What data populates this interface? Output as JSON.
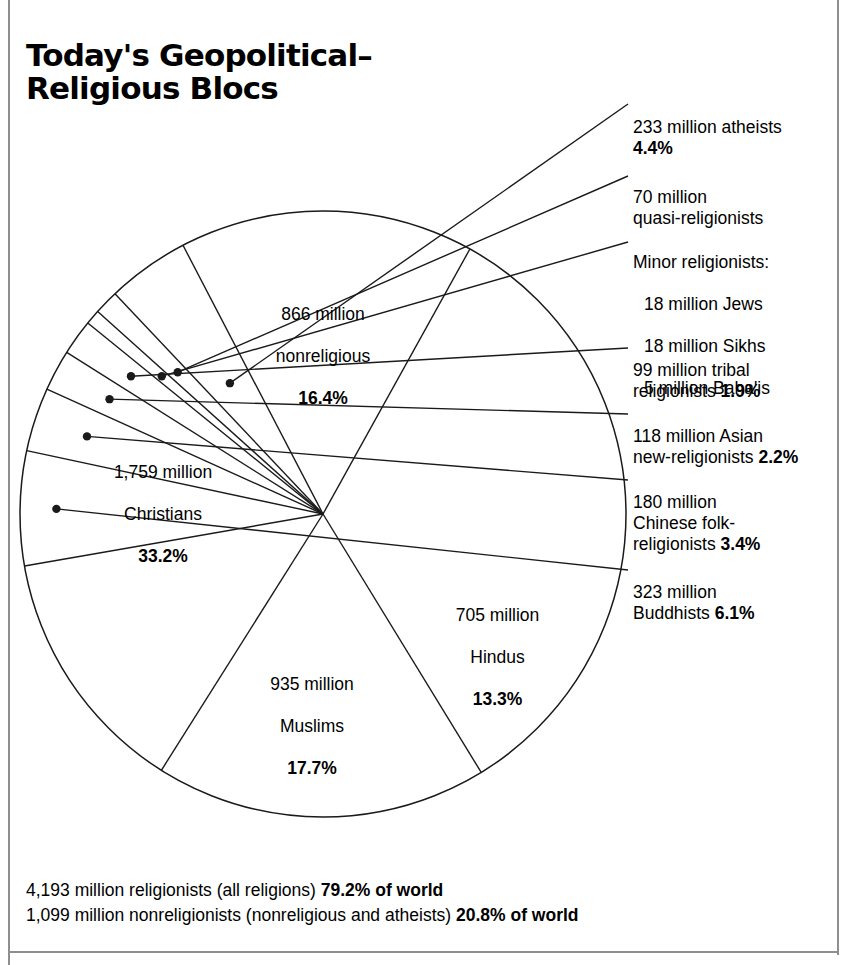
{
  "title": "Today's Geopolitical–\nReligious Blocs",
  "colors": {
    "ink": "#000000",
    "pie_stroke": "#1a1a1a",
    "background": "#ffffff",
    "frame_rule": "#8e8e8e"
  },
  "inner_labels": {
    "nonreligious": {
      "line1": "866 million",
      "line2": "nonreligious",
      "percent": "16.4%"
    },
    "christians": {
      "line1": "1,759 million",
      "line2": "Christians",
      "percent": "33.2%"
    },
    "muslims": {
      "line1": "935 million",
      "line2": "Muslims",
      "percent": "17.7%"
    },
    "hindus": {
      "line1": "705 million",
      "line2": "Hindus",
      "percent": "13.3%"
    }
  },
  "callout_labels": {
    "atheists": {
      "text": "233 million atheists\n",
      "percent": "4.4%"
    },
    "quasi": {
      "text": "70 million\nquasi-religionists",
      "percent": ""
    },
    "minor": {
      "heading": "Minor religionists:",
      "items": [
        "18 million Jews",
        "18 million Sikhs",
        "5 million Baha'is"
      ]
    },
    "tribal": {
      "text": "99 million tribal\nreligionists ",
      "percent": "1.9%"
    },
    "asian": {
      "text": "118 million Asian\nnew-religionists ",
      "percent": "2.2%"
    },
    "chinese": {
      "text": "180 million\nChinese folk-\nreligionists ",
      "percent": "3.4%"
    },
    "buddhists": {
      "text": "323 million\nBuddhists ",
      "percent": "6.1%"
    }
  },
  "footer": {
    "line1_text": "4,193 million religionists (all religions) ",
    "line1_bold": "79.2% of world",
    "line2_text": "1,099 million nonreligionists (nonreligious and atheists) ",
    "line2_bold": "20.8% of world"
  },
  "chart_data": {
    "type": "pie",
    "unit": "million people",
    "total_population": 5292,
    "grid": false,
    "legend": "callout-labels",
    "center": {
      "x": 323,
      "y": 514
    },
    "radius": 303,
    "start_angle_deg": -61.0,
    "direction": "clockwise",
    "categories": [
      "Christians",
      "Muslims",
      "Hindus",
      "Buddhists",
      "Chinese folk-religionists",
      "Asian new-religionists",
      "tribal religionists",
      "Minor religionists",
      "quasi-religionists",
      "atheists",
      "nonreligious"
    ],
    "values_million": [
      1759,
      935,
      705,
      323,
      180,
      118,
      99,
      41,
      70,
      233,
      866
    ],
    "percentages": [
      33.2,
      17.7,
      13.3,
      6.1,
      3.4,
      2.2,
      1.9,
      0.8,
      1.3,
      4.4,
      16.4
    ],
    "slices": [
      {
        "label": "Christians",
        "value": 1759,
        "percent": 33.2,
        "position": "inside"
      },
      {
        "label": "Muslims",
        "value": 935,
        "percent": 17.7,
        "position": "inside"
      },
      {
        "label": "Hindus",
        "value": 705,
        "percent": 13.3,
        "position": "inside"
      },
      {
        "label": "Buddhists",
        "value": 323,
        "percent": 6.1,
        "position": "callout"
      },
      {
        "label": "Chinese folk-religionists",
        "value": 180,
        "percent": 3.4,
        "position": "callout"
      },
      {
        "label": "Asian new-religionists",
        "value": 118,
        "percent": 2.2,
        "position": "callout"
      },
      {
        "label": "tribal religionists",
        "value": 99,
        "percent": 1.9,
        "position": "callout"
      },
      {
        "label": "Minor religionists",
        "value": 41,
        "percent": 0.8,
        "position": "callout",
        "subitems": [
          {
            "label": "Jews",
            "value": 18
          },
          {
            "label": "Sikhs",
            "value": 18
          },
          {
            "label": "Baha'is",
            "value": 5
          }
        ]
      },
      {
        "label": "quasi-religionists",
        "value": 70,
        "percent": 1.3,
        "position": "callout"
      },
      {
        "label": "atheists",
        "value": 233,
        "percent": 4.4,
        "position": "callout"
      },
      {
        "label": "nonreligious",
        "value": 866,
        "percent": 16.4,
        "position": "inside"
      }
    ],
    "summary": [
      {
        "label": "religionists (all religions)",
        "value": 4193,
        "percent": 79.2
      },
      {
        "label": "nonreligionists (nonreligious and atheists)",
        "value": 1099,
        "percent": 20.8
      }
    ]
  }
}
